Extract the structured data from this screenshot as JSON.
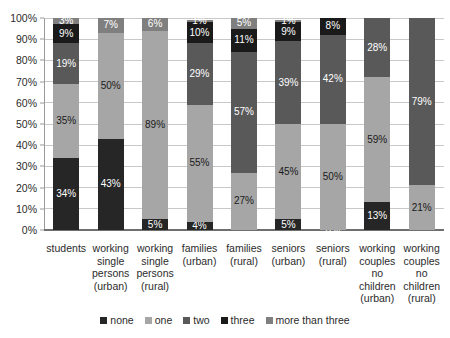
{
  "chart_data": {
    "type": "bar",
    "subtype": "stacked-100-percent",
    "title": "",
    "xlabel": "",
    "ylabel": "",
    "ylim": [
      0,
      100
    ],
    "grid": true,
    "legend_position": "bottom",
    "y_ticks": [
      "0%",
      "10%",
      "20%",
      "30%",
      "40%",
      "50%",
      "60%",
      "70%",
      "80%",
      "90%",
      "100%"
    ],
    "categories": [
      "students",
      "working single persons (urban)",
      "working single persons (rural)",
      "families (urban)",
      "families (rural)",
      "seniors (urban)",
      "seniors (rural)",
      "working couples no children (urban)",
      "working couples no children (rural)"
    ],
    "category_lines": [
      [
        "students"
      ],
      [
        "working",
        "single",
        "persons",
        "(urban)"
      ],
      [
        "working",
        "single",
        "persons",
        "(rural)"
      ],
      [
        "families",
        "(urban)"
      ],
      [
        "families",
        "(rural)"
      ],
      [
        "seniors",
        "(urban)"
      ],
      [
        "seniors",
        "(rural)"
      ],
      [
        "working",
        "couples",
        "no",
        "children",
        "(urban)"
      ],
      [
        "working",
        "couples",
        "no",
        "children",
        "(rural)"
      ]
    ],
    "series": [
      {
        "name": "none",
        "color": "#262626",
        "values": [
          34,
          43,
          5,
          4,
          0,
          5,
          0,
          13,
          0
        ]
      },
      {
        "name": "one",
        "color": "#a6a6a6",
        "values": [
          35,
          50,
          89,
          55,
          27,
          45,
          50,
          59,
          21
        ]
      },
      {
        "name": "two",
        "color": "#595959",
        "values": [
          19,
          0,
          0,
          29,
          57,
          39,
          42,
          28,
          79
        ]
      },
      {
        "name": "three",
        "color": "#1a1a1a",
        "values": [
          9,
          0,
          0,
          10,
          11,
          9,
          8,
          0,
          0
        ]
      },
      {
        "name": "more than three",
        "color": "#7f7f7f",
        "values": [
          3,
          7,
          6,
          1,
          5,
          1,
          0,
          0,
          0
        ]
      }
    ],
    "bar_segments": [
      [
        {
          "series": "none",
          "value": 34,
          "label": "34%"
        },
        {
          "series": "one",
          "value": 35,
          "label": "35%"
        },
        {
          "series": "two",
          "value": 19,
          "label": "19%"
        },
        {
          "series": "three",
          "value": 9,
          "label": "9%"
        },
        {
          "series": "more than three",
          "value": 3,
          "label": "3%"
        }
      ],
      [
        {
          "series": "none",
          "value": 43,
          "label": "43%"
        },
        {
          "series": "one",
          "value": 50,
          "label": "50%"
        },
        {
          "series": "two",
          "value": 0,
          "label": ""
        },
        {
          "series": "three",
          "value": 0,
          "label": ""
        },
        {
          "series": "more than three",
          "value": 7,
          "label": "7%"
        }
      ],
      [
        {
          "series": "none",
          "value": 5,
          "label": "5%"
        },
        {
          "series": "one",
          "value": 89,
          "label": "89%"
        },
        {
          "series": "two",
          "value": 0,
          "label": ""
        },
        {
          "series": "three",
          "value": 0,
          "label": ""
        },
        {
          "series": "more than three",
          "value": 6,
          "label": "6%"
        }
      ],
      [
        {
          "series": "none",
          "value": 4,
          "label": "4%"
        },
        {
          "series": "one",
          "value": 55,
          "label": "55%"
        },
        {
          "series": "two",
          "value": 29,
          "label": "29%"
        },
        {
          "series": "three",
          "value": 10,
          "label": "10%"
        },
        {
          "series": "more than three",
          "value": 1,
          "label": "1%"
        }
      ],
      [
        {
          "series": "none",
          "value": 0,
          "label": ""
        },
        {
          "series": "one",
          "value": 27,
          "label": "27%"
        },
        {
          "series": "two",
          "value": 57,
          "label": "57%"
        },
        {
          "series": "three",
          "value": 11,
          "label": "11%"
        },
        {
          "series": "more than three",
          "value": 5,
          "label": "5%"
        }
      ],
      [
        {
          "series": "none",
          "value": 5,
          "label": "5%"
        },
        {
          "series": "one",
          "value": 45,
          "label": "45%"
        },
        {
          "series": "two",
          "value": 39,
          "label": "39%"
        },
        {
          "series": "three",
          "value": 9,
          "label": "9%"
        },
        {
          "series": "more than three",
          "value": 1,
          "label": "1%"
        }
      ],
      [
        {
          "series": "none",
          "value": 0,
          "label": "0%"
        },
        {
          "series": "one",
          "value": 50,
          "label": "50%"
        },
        {
          "series": "two",
          "value": 42,
          "label": "42%"
        },
        {
          "series": "three",
          "value": 8,
          "label": "8%"
        },
        {
          "series": "more than three",
          "value": 0,
          "label": ""
        }
      ],
      [
        {
          "series": "none",
          "value": 13,
          "label": "13%"
        },
        {
          "series": "one",
          "value": 59,
          "label": "59%"
        },
        {
          "series": "two",
          "value": 28,
          "label": "28%"
        },
        {
          "series": "three",
          "value": 0,
          "label": ""
        },
        {
          "series": "more than three",
          "value": 0,
          "label": ""
        }
      ],
      [
        {
          "series": "none",
          "value": 0,
          "label": ""
        },
        {
          "series": "one",
          "value": 21,
          "label": "21%"
        },
        {
          "series": "two",
          "value": 79,
          "label": "79%"
        },
        {
          "series": "three",
          "value": 0,
          "label": ""
        },
        {
          "series": "more than three",
          "value": 0,
          "label": ""
        }
      ]
    ],
    "legend": [
      {
        "label": "none",
        "color": "#262626"
      },
      {
        "label": "one",
        "color": "#a6a6a6"
      },
      {
        "label": "two",
        "color": "#595959"
      },
      {
        "label": "three",
        "color": "#1a1a1a"
      },
      {
        "label": "more than three",
        "color": "#7f7f7f"
      }
    ]
  }
}
